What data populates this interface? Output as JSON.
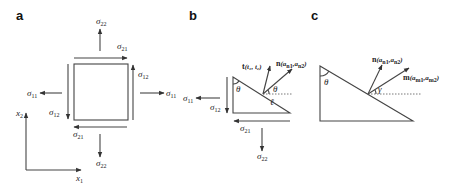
{
  "figure": {
    "panels": [
      {
        "id": "a",
        "label": "a",
        "description": "Square stress element with normal and shear stresses",
        "stresses": {
          "top_normal": {
            "sym": "σ",
            "sub": "22"
          },
          "top_shear": {
            "sym": "σ",
            "sub": "21"
          },
          "right_shear": {
            "sym": "σ",
            "sub": "12"
          },
          "right_normal": {
            "sym": "σ",
            "sub": "11"
          },
          "left_normal": {
            "sym": "σ",
            "sub": "11"
          },
          "left_shear": {
            "sym": "σ",
            "sub": "12"
          },
          "bottom_shear": {
            "sym": "σ",
            "sub": "21"
          },
          "bottom_normal": {
            "sym": "σ",
            "sub": "22"
          }
        },
        "axes": {
          "vertical": {
            "sym": "x",
            "sub": "2"
          },
          "horizontal": {
            "sym": "x",
            "sub": "1"
          }
        }
      },
      {
        "id": "b",
        "label": "b",
        "description": "Triangular wedge cut with traction and normal vectors",
        "stresses": {
          "left_normal": {
            "sym": "σ",
            "sub": "11"
          },
          "left_shear": {
            "sym": "σ",
            "sub": "12"
          },
          "bottom_shear": {
            "sym": "σ",
            "sub": "21"
          },
          "bottom_normal": {
            "sym": "σ",
            "sub": "22"
          }
        },
        "vectors": {
          "traction": {
            "name": "t",
            "args": "(t₁, t₂)"
          },
          "normal": {
            "name": "n",
            "args": "(a",
            "sub1": "n1",
            "mid": ",a",
            "sub2": "n2",
            "close": ")"
          }
        },
        "angles": {
          "top": "θ",
          "at_point": "θ"
        },
        "length_label": "ℓ"
      },
      {
        "id": "c",
        "label": "c",
        "description": "Wedge with normal vector n and direction vector m",
        "vectors": {
          "normal": {
            "name": "n",
            "args": "(a",
            "sub1": "n1",
            "mid": ",a",
            "sub2": "n2",
            "close": ")"
          },
          "direction": {
            "name": "m",
            "args": "(a",
            "sub1": "m1",
            "mid": ",a",
            "sub2": "m2",
            "close": ")"
          }
        },
        "angles": {
          "top": "θ",
          "at_point": "γ"
        }
      }
    ]
  }
}
